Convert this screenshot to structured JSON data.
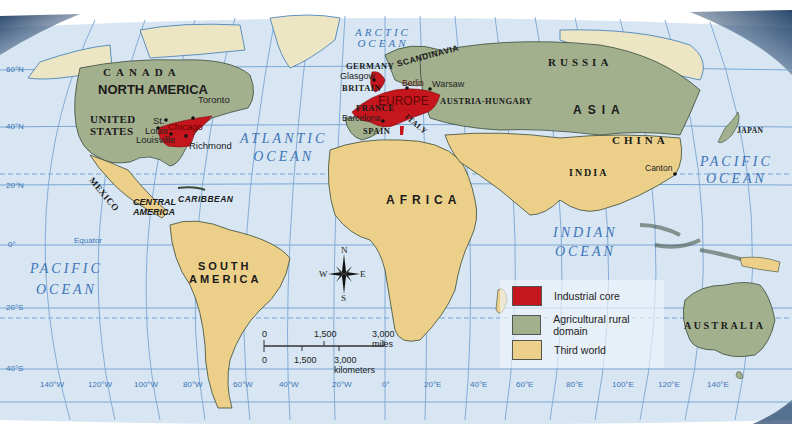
{
  "map": {
    "colors": {
      "ocean": "#d7e6f2",
      "grid": "#7aa6d4",
      "industrial_core": "#c4161c",
      "agricultural_rural": "#a3b08e",
      "third_world": "#ecd08a",
      "unclassified_land": "#ede6c5",
      "ocean_label": "#3d74b8",
      "globe_shadow": "#1f3f66"
    },
    "oceans": [
      {
        "name": "arctic",
        "line1": "ARCTIC",
        "line2": "OCEAN"
      },
      {
        "name": "atlantic",
        "line1": "ATLANTIC",
        "line2": "OCEAN"
      },
      {
        "name": "pacific-east",
        "line1": "PACIFIC",
        "line2": "OCEAN"
      },
      {
        "name": "pacific-west",
        "line1": "PACIFIC",
        "line2": "OCEAN"
      },
      {
        "name": "indian",
        "line1": "INDIAN",
        "line2": "OCEAN"
      }
    ],
    "continents": {
      "north_america": "NORTH AMERICA",
      "south_america_1": "SOUTH",
      "south_america_2": "AMERICA",
      "europe": "EUROPE",
      "africa": "AFRICA",
      "asia": "ASIA",
      "central_america_1": "CENTRAL",
      "central_america_2": "AMERICA"
    },
    "countries": {
      "canada": "CANADA",
      "united_states_1": "UNITED",
      "united_states_2": "STATES",
      "mexico": "MEXICO",
      "germany": "GERMANY",
      "scandinavia": "SCANDINAVIA",
      "britain": "BRITAIN",
      "france": "FRANCE",
      "spain": "SPAIN",
      "italy": "ITALY",
      "austria_hungary": "AUSTRIA-HUNGARY",
      "russia": "RUSSIA",
      "china": "CHINA",
      "india": "INDIA",
      "japan": "JAPAN",
      "australia": "AUSTRALIA",
      "caribbean": "CARIBBEAN"
    },
    "cities": {
      "toronto": "Toronto",
      "st_louis_1": "St.",
      "st_louis_2": "Louis",
      "chicago": "Chicago",
      "louisville": "Louisville",
      "richmond": "Richmond",
      "glasgow": "Glasgow",
      "berlin": "Berlin",
      "warsaw": "Warsaw",
      "barcelona": "Barcelona",
      "canton": "Canton"
    },
    "latitudes": [
      "60°N",
      "40°N",
      "20°N",
      "0°",
      "20°S",
      "40°S"
    ],
    "equator_label": "Equator",
    "longitudes": [
      "140°W",
      "120°W",
      "100°W",
      "80°W",
      "60°W",
      "40°W",
      "20°W",
      "0°",
      "20°E",
      "40°E",
      "60°E",
      "80°E",
      "100°E",
      "120°E",
      "140°E"
    ],
    "compass": {
      "n": "N",
      "s": "S",
      "e": "E",
      "w": "W"
    },
    "scale": {
      "miles_ticks": [
        "0",
        "1,500",
        "3,000 miles"
      ],
      "km_ticks": [
        "0",
        "1,500",
        "3,000 kilometers"
      ]
    }
  },
  "legend": {
    "items": [
      {
        "label": "Industrial core",
        "color": "#c4161c"
      },
      {
        "label": "Agricultural rural domain",
        "color": "#a3b08e"
      },
      {
        "label": "Third world",
        "color": "#ecd08a"
      }
    ]
  }
}
